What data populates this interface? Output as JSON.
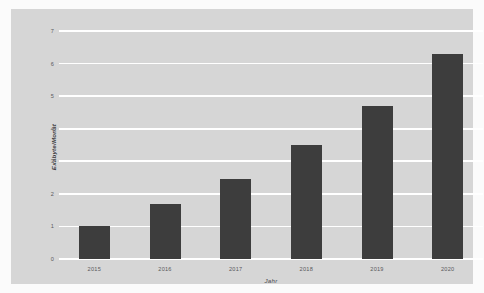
{
  "chart_data": {
    "type": "bar",
    "title": "",
    "subtitle": "",
    "xlabel": "Jahr",
    "ylabel": "Exabyte/Monat",
    "categories": [
      "2015",
      "2016",
      "2017",
      "2018",
      "2019",
      "2020"
    ],
    "values": [
      1.0,
      1.7,
      2.45,
      3.5,
      4.7,
      6.3
    ],
    "series": [
      {
        "name": "Exabyte/Monat",
        "values": [
          1.0,
          1.7,
          2.45,
          3.5,
          4.7,
          6.3
        ]
      }
    ],
    "ylim": [
      0,
      7
    ],
    "yticks": [
      0,
      1,
      2,
      3,
      4,
      5,
      6,
      7
    ],
    "ytick_labels": [
      "0",
      "1",
      "2",
      "3",
      "4",
      "5",
      "6",
      "7"
    ],
    "xtick_labels": [
      "2015",
      "2016",
      "2017",
      "2018",
      "2019",
      "2020"
    ],
    "grid": true,
    "grid_axis": "y",
    "legend": false,
    "legend_position": "none",
    "annotations": []
  },
  "style": {
    "bar_color": "#3d3d3d",
    "panel_background": "#d6d6d6",
    "figure_background": "#fbfbfb",
    "gridline_color": "#ffffff",
    "tick_label_color": "#59595c",
    "axis_title_color": "#3f3f42"
  }
}
